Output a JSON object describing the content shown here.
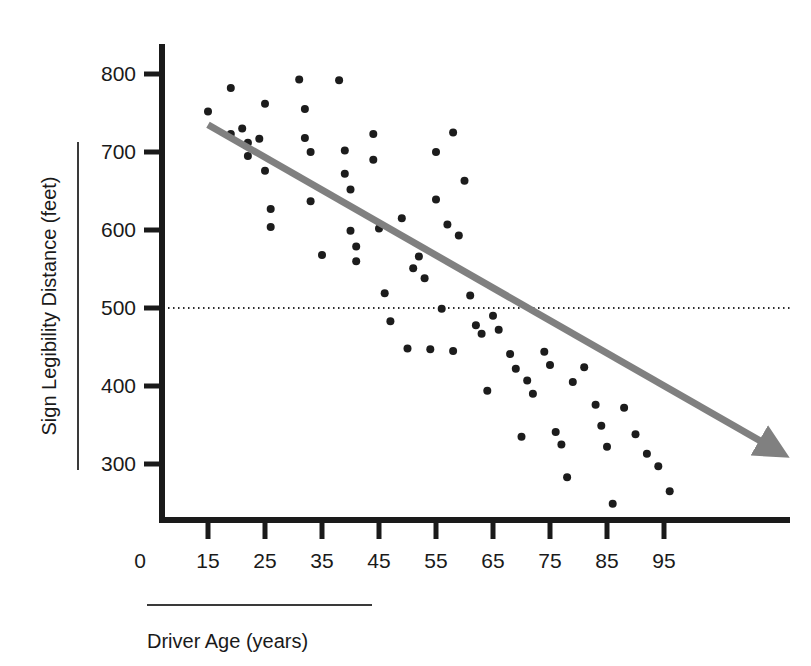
{
  "chart_data": {
    "type": "scatter",
    "title": "",
    "xlabel": "Driver Age (years)",
    "ylabel": "Sign Legibility Distance (feet)",
    "xlim": [
      10,
      110
    ],
    "ylim": [
      240,
      840
    ],
    "xticks": [
      15,
      25,
      35,
      45,
      55,
      65,
      75,
      85,
      95
    ],
    "xtick_labels": [
      "15",
      "25",
      "35",
      "45",
      "55",
      "65",
      "75",
      "85",
      "95"
    ],
    "yticks": [
      300,
      400,
      500,
      600,
      700,
      800
    ],
    "ytick_labels": [
      "300",
      "400",
      "500",
      "600",
      "700",
      "800"
    ],
    "origin_label": "0",
    "grid": false,
    "legend": null,
    "axis_break": true,
    "marker_color": "#1c1c1c",
    "marker_size": 7,
    "reference_line": {
      "name": "horizontal-reference-line",
      "orientation": "horizontal",
      "y": 500,
      "style": "dotted",
      "color": "#2b2b2b",
      "label": ""
    },
    "trend_line": {
      "name": "regression-trend-arrow",
      "style": "solid-with-arrowhead",
      "color": "#808080",
      "width": 7,
      "x_start": 15,
      "y_start": 735,
      "x_end": 113,
      "y_end": 325,
      "slope": -4.18,
      "intercept": 797.7
    },
    "points": [
      {
        "x": 15,
        "y": 752
      },
      {
        "x": 19,
        "y": 782
      },
      {
        "x": 19,
        "y": 723
      },
      {
        "x": 21,
        "y": 730
      },
      {
        "x": 22,
        "y": 712
      },
      {
        "x": 22,
        "y": 695
      },
      {
        "x": 24,
        "y": 717
      },
      {
        "x": 25,
        "y": 762
      },
      {
        "x": 25,
        "y": 676
      },
      {
        "x": 26,
        "y": 627
      },
      {
        "x": 26,
        "y": 604
      },
      {
        "x": 31,
        "y": 793
      },
      {
        "x": 32,
        "y": 755
      },
      {
        "x": 32,
        "y": 718
      },
      {
        "x": 33,
        "y": 700
      },
      {
        "x": 33,
        "y": 637
      },
      {
        "x": 35,
        "y": 568
      },
      {
        "x": 38,
        "y": 792
      },
      {
        "x": 39,
        "y": 702
      },
      {
        "x": 39,
        "y": 672
      },
      {
        "x": 40,
        "y": 652
      },
      {
        "x": 40,
        "y": 599
      },
      {
        "x": 41,
        "y": 579
      },
      {
        "x": 41,
        "y": 560
      },
      {
        "x": 44,
        "y": 723
      },
      {
        "x": 44,
        "y": 690
      },
      {
        "x": 45,
        "y": 602
      },
      {
        "x": 46,
        "y": 519
      },
      {
        "x": 47,
        "y": 483
      },
      {
        "x": 49,
        "y": 615
      },
      {
        "x": 50,
        "y": 448
      },
      {
        "x": 51,
        "y": 551
      },
      {
        "x": 52,
        "y": 566
      },
      {
        "x": 53,
        "y": 538
      },
      {
        "x": 54,
        "y": 447
      },
      {
        "x": 55,
        "y": 700
      },
      {
        "x": 55,
        "y": 639
      },
      {
        "x": 56,
        "y": 499
      },
      {
        "x": 57,
        "y": 607
      },
      {
        "x": 58,
        "y": 445
      },
      {
        "x": 58,
        "y": 725
      },
      {
        "x": 59,
        "y": 593
      },
      {
        "x": 60,
        "y": 663
      },
      {
        "x": 61,
        "y": 516
      },
      {
        "x": 62,
        "y": 478
      },
      {
        "x": 63,
        "y": 467
      },
      {
        "x": 64,
        "y": 394
      },
      {
        "x": 65,
        "y": 490
      },
      {
        "x": 66,
        "y": 472
      },
      {
        "x": 68,
        "y": 441
      },
      {
        "x": 69,
        "y": 422
      },
      {
        "x": 70,
        "y": 335
      },
      {
        "x": 71,
        "y": 407
      },
      {
        "x": 72,
        "y": 390
      },
      {
        "x": 74,
        "y": 444
      },
      {
        "x": 75,
        "y": 427
      },
      {
        "x": 76,
        "y": 341
      },
      {
        "x": 77,
        "y": 325
      },
      {
        "x": 78,
        "y": 283
      },
      {
        "x": 79,
        "y": 405
      },
      {
        "x": 81,
        "y": 424
      },
      {
        "x": 83,
        "y": 376
      },
      {
        "x": 84,
        "y": 349
      },
      {
        "x": 85,
        "y": 322
      },
      {
        "x": 86,
        "y": 249
      },
      {
        "x": 88,
        "y": 372
      },
      {
        "x": 90,
        "y": 338
      },
      {
        "x": 92,
        "y": 313
      },
      {
        "x": 94,
        "y": 297
      },
      {
        "x": 96,
        "y": 265
      }
    ]
  }
}
